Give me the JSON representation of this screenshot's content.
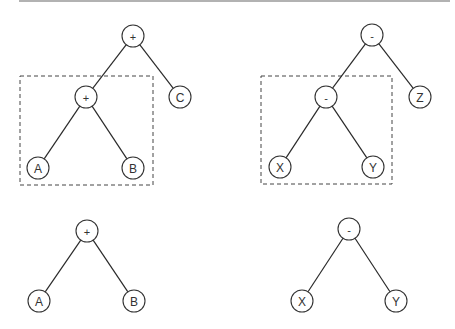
{
  "diagram": {
    "title": "",
    "colors": {
      "line": "#2a2a2a",
      "node_stroke": "#333333",
      "node_fill": "#ffffff",
      "box_stroke": "#444444",
      "rule": "#666666"
    },
    "node_radius": 11,
    "top_rule": {
      "x1": 19,
      "y1": 1,
      "x2": 450,
      "y2": 1
    },
    "trees": [
      {
        "id": "tree-plus-full",
        "nodes": [
          {
            "id": "p-root",
            "label": "+",
            "x": 133,
            "y": 36,
            "op": true
          },
          {
            "id": "p-inner",
            "label": "+",
            "x": 86,
            "y": 97,
            "op": true
          },
          {
            "id": "p-c",
            "label": "C",
            "x": 180,
            "y": 97,
            "op": false
          },
          {
            "id": "p-a",
            "label": "A",
            "x": 38,
            "y": 168,
            "op": false
          },
          {
            "id": "p-b",
            "label": "B",
            "x": 133,
            "y": 168,
            "op": false
          }
        ],
        "edges": [
          [
            "p-root",
            "p-inner"
          ],
          [
            "p-root",
            "p-c"
          ],
          [
            "p-inner",
            "p-a"
          ],
          [
            "p-inner",
            "p-b"
          ]
        ],
        "highlight_box": {
          "x": 20,
          "y": 76,
          "width": 133,
          "height": 109
        }
      },
      {
        "id": "tree-minus-full",
        "nodes": [
          {
            "id": "m-root",
            "label": "-",
            "x": 372,
            "y": 35,
            "op": true
          },
          {
            "id": "m-inner",
            "label": "-",
            "x": 326,
            "y": 97,
            "op": true
          },
          {
            "id": "m-z",
            "label": "Z",
            "x": 420,
            "y": 97,
            "op": false
          },
          {
            "id": "m-x",
            "label": "X",
            "x": 280,
            "y": 167,
            "op": false
          },
          {
            "id": "m-y",
            "label": "Y",
            "x": 373,
            "y": 167,
            "op": false
          }
        ],
        "edges": [
          [
            "m-root",
            "m-inner"
          ],
          [
            "m-root",
            "m-z"
          ],
          [
            "m-inner",
            "m-x"
          ],
          [
            "m-inner",
            "m-y"
          ]
        ],
        "highlight_box": {
          "x": 261,
          "y": 76,
          "width": 131,
          "height": 108
        }
      },
      {
        "id": "tree-plus-sub",
        "nodes": [
          {
            "id": "ps-root",
            "label": "+",
            "x": 87,
            "y": 231,
            "op": true
          },
          {
            "id": "ps-a",
            "label": "A",
            "x": 39,
            "y": 301,
            "op": false
          },
          {
            "id": "ps-b",
            "label": "B",
            "x": 134,
            "y": 301,
            "op": false
          }
        ],
        "edges": [
          [
            "ps-root",
            "ps-a"
          ],
          [
            "ps-root",
            "ps-b"
          ]
        ],
        "highlight_box": null
      },
      {
        "id": "tree-minus-sub",
        "nodes": [
          {
            "id": "ms-root",
            "label": "-",
            "x": 349,
            "y": 229,
            "op": true
          },
          {
            "id": "ms-x",
            "label": "X",
            "x": 302,
            "y": 301,
            "op": false
          },
          {
            "id": "ms-y",
            "label": "Y",
            "x": 396,
            "y": 301,
            "op": false
          }
        ],
        "edges": [
          [
            "ms-root",
            "ms-x"
          ],
          [
            "ms-root",
            "ms-y"
          ]
        ],
        "highlight_box": null
      }
    ]
  }
}
